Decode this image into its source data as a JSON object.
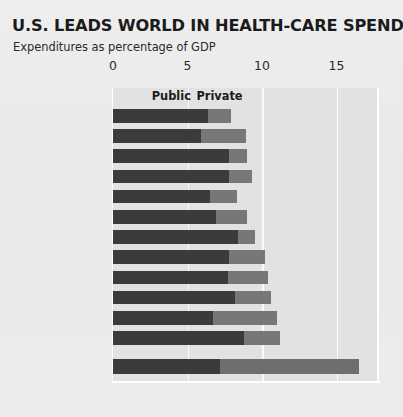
{
  "title": "U.S. LEADS WORLD IN HEALTH-CARE SPENDING",
  "subtitle": "Expenditures as percentage of GDP",
  "legend": {
    "public_label": "Public",
    "private_label": "Private"
  },
  "colors": {
    "public": "#3b3b3b",
    "private": "#777777",
    "plot_background": "#e2e2e2",
    "page_background": "#ebebeb",
    "gridline": "#fafafa",
    "text": "#202020"
  },
  "chart_data": {
    "type": "bar",
    "orientation": "horizontal",
    "stacked": true,
    "title": "U.S. LEADS WORLD IN HEALTH-CARE SPENDING",
    "subtitle": "Expenditures as percentage of GDP",
    "xlabel": "",
    "ylabel": "",
    "xlim": [
      0,
      17.8
    ],
    "xticks": [
      0,
      5,
      10,
      15
    ],
    "xtick_labels": [
      "0",
      "5",
      "10",
      "15"
    ],
    "grid": "vertical-white",
    "legend_position": "top-inside",
    "categories": [
      "Japan",
      "Australia",
      "Norway",
      "United Kingdom",
      "Spain",
      "Italy",
      "Sweden",
      "Canada",
      "Austria",
      "Germany",
      "Switzerland",
      "France",
      "United States"
    ],
    "highlight_category": "United States",
    "series": [
      {
        "name": "Public",
        "values": [
          6.4,
          5.9,
          7.8,
          7.8,
          6.5,
          6.9,
          8.4,
          7.8,
          7.7,
          8.2,
          6.7,
          8.8,
          7.2
        ]
      },
      {
        "name": "Private",
        "values": [
          1.5,
          3.0,
          1.2,
          1.5,
          1.8,
          2.1,
          1.1,
          2.4,
          2.7,
          2.4,
          4.3,
          2.4,
          9.3
        ]
      }
    ],
    "totals": [
      7.9,
      8.9,
      9.0,
      9.3,
      8.3,
      9.0,
      9.5,
      10.2,
      10.4,
      10.6,
      11.0,
      11.2,
      16.5
    ]
  }
}
